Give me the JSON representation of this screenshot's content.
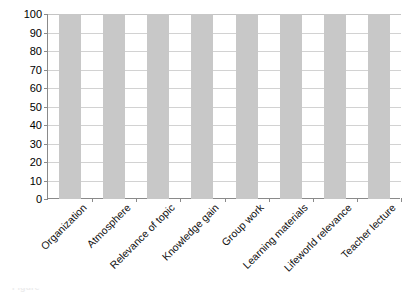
{
  "chart_data": {
    "type": "bar",
    "title": "",
    "subtitle": "",
    "xlabel": "",
    "ylabel": "",
    "categories": [
      "Organization",
      "Atmosphere",
      "Relevance of topic",
      "Knowledge gain",
      "Group work",
      "Learning materials",
      "Lifeworld relevance",
      "Teacher lecture"
    ],
    "values": [
      100,
      100,
      100,
      100,
      100,
      100,
      100,
      100
    ],
    "ylim": [
      0,
      100
    ],
    "ytick_labels": [
      "0",
      "10",
      "20",
      "30",
      "40",
      "50",
      "60",
      "70",
      "80",
      "90",
      "100"
    ],
    "ytick_values": [
      0,
      10,
      20,
      30,
      40,
      50,
      60,
      70,
      80,
      90,
      100
    ],
    "grid": true,
    "legend": false,
    "legend_position": "none",
    "annotations": [],
    "colors": {
      "bar_fill": "#c8c8c8",
      "gridline": "#d2d2d2",
      "axis_line": "#8a8a8a",
      "label_text": "#101010",
      "background": "#ffffff"
    }
  },
  "caption": {
    "sliver_text": "Figure"
  }
}
